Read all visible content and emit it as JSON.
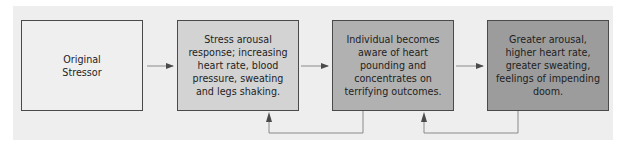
{
  "diagram": {
    "type": "flowchart",
    "background_color": "#eeeeee",
    "nodes": [
      {
        "id": "n1",
        "label": "Original Stressor",
        "fill": "#efefef"
      },
      {
        "id": "n2",
        "label": "Stress arousal response; increasing heart rate, blood pressure, sweating and legs shaking.",
        "fill": "#d3d3d3"
      },
      {
        "id": "n3",
        "label": "Individual becomes aware of heart pounding and concentrates on terrifying outcomes.",
        "fill": "#b1b1b1"
      },
      {
        "id": "n4",
        "label": "Greater arousal, higher heart rate, greater sweating, feelings of impending doom.",
        "fill": "#9c9c9c"
      }
    ],
    "edges": [
      {
        "from": "n1",
        "to": "n2",
        "kind": "forward"
      },
      {
        "from": "n2",
        "to": "n3",
        "kind": "forward"
      },
      {
        "from": "n3",
        "to": "n4",
        "kind": "forward"
      },
      {
        "from": "n3",
        "to": "n2",
        "kind": "feedback"
      },
      {
        "from": "n4",
        "to": "n3",
        "kind": "feedback"
      }
    ],
    "line_color": "#8a8a8a",
    "arrowhead_color": "#4a4a4a"
  }
}
